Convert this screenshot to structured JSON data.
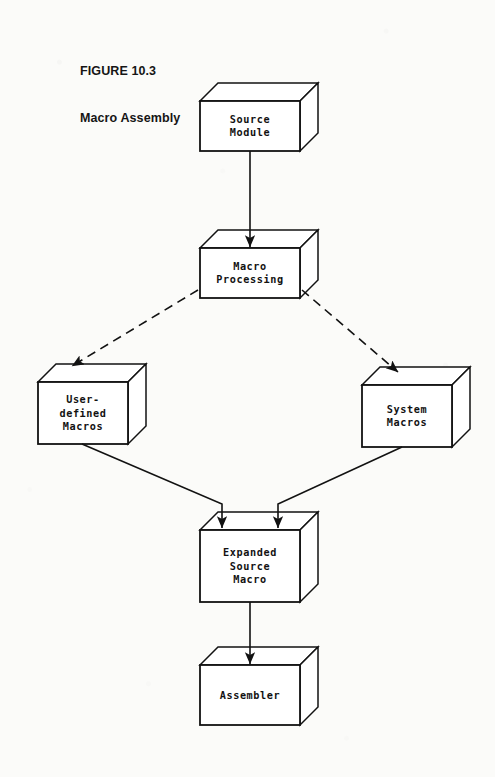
{
  "figure": {
    "label": "FIGURE 10.3",
    "title": "Macro Assembly"
  },
  "colors": {
    "ink": "#121212",
    "page": "#fbfbf9",
    "box_fill": "#ffffff"
  },
  "diagram": {
    "type": "flowchart",
    "nodes": [
      {
        "id": "source-module",
        "lines": [
          "Source",
          "Module"
        ],
        "x": 200,
        "y": 101,
        "w": 100,
        "h": 50,
        "depth": 18
      },
      {
        "id": "macro-processing",
        "lines": [
          "Macro",
          "Processing"
        ],
        "x": 200,
        "y": 248,
        "w": 100,
        "h": 50,
        "depth": 18
      },
      {
        "id": "user-defined-macros",
        "lines": [
          "User-",
          "defined",
          "Macros"
        ],
        "x": 38,
        "y": 382,
        "w": 90,
        "h": 62,
        "depth": 18
      },
      {
        "id": "system-macros",
        "lines": [
          "System",
          "Macros"
        ],
        "x": 362,
        "y": 385,
        "w": 90,
        "h": 62,
        "depth": 18
      },
      {
        "id": "expanded-source-macro",
        "lines": [
          "Expanded",
          "Source",
          "Macro"
        ],
        "x": 200,
        "y": 530,
        "w": 100,
        "h": 72,
        "depth": 18
      },
      {
        "id": "assembler",
        "lines": [
          "Assembler"
        ],
        "x": 200,
        "y": 665,
        "w": 100,
        "h": 60,
        "depth": 18
      }
    ],
    "edges": [
      {
        "id": "source-to-macro-processing",
        "style": "solid",
        "from": "source-module",
        "to": "macro-processing"
      },
      {
        "id": "macro-processing-to-user-macros",
        "style": "dashed",
        "from": "macro-processing",
        "to": "user-defined-macros"
      },
      {
        "id": "macro-processing-to-system-macros",
        "style": "dashed",
        "from": "macro-processing",
        "to": "system-macros"
      },
      {
        "id": "user-macros-to-expanded",
        "style": "solid",
        "from": "user-defined-macros",
        "to": "expanded-source-macro"
      },
      {
        "id": "system-macros-to-expanded",
        "style": "solid",
        "from": "system-macros",
        "to": "expanded-source-macro"
      },
      {
        "id": "expanded-to-assembler",
        "style": "solid",
        "from": "expanded-source-macro",
        "to": "assembler"
      }
    ]
  }
}
